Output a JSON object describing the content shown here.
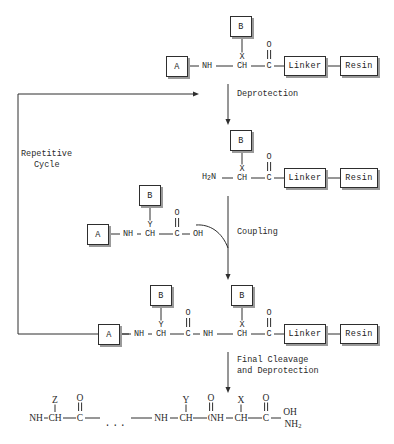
{
  "diagram": {
    "colors": {
      "stroke": "#2e2e2e",
      "shadow": "#9a9a9a",
      "text": "#2a2a2a",
      "background": "#ffffff"
    }
  },
  "labels": {
    "repetitive_cycle_line1": "Repetitive",
    "repetitive_cycle_line2": "Cycle",
    "deprotection": "Deprotection",
    "coupling": "Coupling",
    "final_cleavage_line1": "Final Cleavage",
    "final_cleavage_line2": "and Deprotection",
    "ellipsis": "..."
  },
  "boxes": {
    "protecting_group": "B",
    "group_a": "A",
    "linker": "Linker",
    "resin": "Resin"
  },
  "row1": {
    "name": "protected-amino-acid-on-resin",
    "box_b": "B",
    "box_a": "A",
    "side_chain": "X",
    "n_terminus": "NH",
    "alpha_carbon": "CH",
    "carbonyl_carbon": "C",
    "carbonyl_oxygen": "O",
    "linker": "Linker",
    "resin": "Resin"
  },
  "row2": {
    "name": "deprotected-amino-acid-on-resin",
    "box_b": "B",
    "side_chain": "X",
    "n_terminus": "H2N",
    "n_terminus_html": "H<sub>2</sub>N",
    "alpha_carbon": "CH",
    "carbonyl_carbon": "C",
    "carbonyl_oxygen": "O",
    "linker": "Linker",
    "resin": "Resin"
  },
  "row3": {
    "name": "incoming-protected-amino-acid",
    "box_b": "B",
    "box_a": "A",
    "side_chain": "Y",
    "n_terminus": "NH",
    "alpha_carbon": "CH",
    "carbonyl_carbon": "C",
    "carbonyl_oxygen": "O",
    "acid_terminus": "OH"
  },
  "row4": {
    "name": "coupled-dipeptide-on-resin",
    "box_b_left": "B",
    "box_b_right": "B",
    "box_a": "A",
    "side_chain_left": "Y",
    "side_chain_right": "X",
    "n_terminus_left": "NH",
    "alpha_carbon_left": "CH",
    "carbonyl_carbon_left": "C",
    "carbonyl_oxygen_left": "O",
    "amide_nitrogen": "NH",
    "alpha_carbon_right": "CH",
    "carbonyl_carbon_right": "C",
    "carbonyl_oxygen_right": "O",
    "linker": "Linker",
    "resin": "Resin"
  },
  "row5": {
    "name": "final-free-peptide",
    "n_terminus_1": "NH",
    "side_chain_1": "Z",
    "alpha_carbon_1": "CH",
    "carbonyl_carbon_1": "C",
    "carbonyl_oxygen_1": "O",
    "ellipsis": "...",
    "n_terminus_2": "NH",
    "side_chain_2": "Y",
    "alpha_carbon_2": "CH",
    "carbonyl_carbon_2": "C",
    "carbonyl_oxygen_2": "O",
    "n_terminus_3": "NH",
    "side_chain_3": "X",
    "alpha_carbon_3": "CH",
    "carbonyl_carbon_3": "C",
    "carbonyl_oxygen_3": "O",
    "terminus_oh": "OH",
    "terminus_nh2": "NH2",
    "terminus_nh2_html": "NH<sub>2</sub>"
  }
}
